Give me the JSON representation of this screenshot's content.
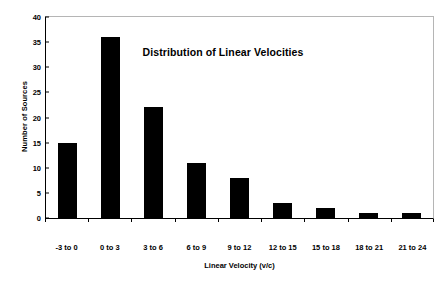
{
  "chart_data": {
    "type": "bar",
    "title": "Distribution of Linear Velocities",
    "xlabel": "Linear Velocity (v/c)",
    "ylabel": "Number of Sources",
    "categories": [
      "-3 to 0",
      "0 to 3",
      "3 to 6",
      "6 to 9",
      "9 to 12",
      "12 to 15",
      "15 to 18",
      "18 to 21",
      "21 to 24"
    ],
    "values": [
      15,
      36,
      22,
      11,
      8,
      3,
      2,
      1,
      1
    ],
    "ylim": [
      0,
      40
    ],
    "ytick_values": [
      0,
      5,
      10,
      15,
      20,
      25,
      30,
      35,
      40
    ],
    "ytick_labels": [
      "0",
      "5",
      "10",
      "15",
      "20",
      "25",
      "30",
      "35",
      "40"
    ],
    "grid": false,
    "legend": null,
    "bar_color": "#000000",
    "background_color": "#ffffff",
    "axis_color": "#000000",
    "frame_color": "#b5b5b5"
  }
}
